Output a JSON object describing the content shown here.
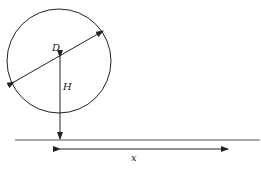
{
  "diagram": {
    "labels": {
      "diameter": "D",
      "height": "H",
      "distance": "x"
    },
    "colors": {
      "stroke": "#222222",
      "ground": "#555555",
      "background": "#ffffff"
    },
    "elements": [
      "circle",
      "diameter-arrow",
      "height-arrow",
      "ground-line",
      "distance-arrow"
    ]
  }
}
